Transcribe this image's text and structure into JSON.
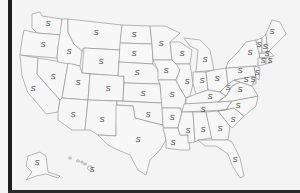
{
  "map": {
    "title": "",
    "region": "United States",
    "state_label_text": "S",
    "label_color": "#444444",
    "border_color": "#8a8a8a",
    "background": "#f4f4f4",
    "labels": [
      {
        "state": "WA",
        "text": "S",
        "x": 48,
        "y": 24
      },
      {
        "state": "OR",
        "text": "S",
        "x": 43,
        "y": 45
      },
      {
        "state": "CA",
        "text": "S",
        "x": 33,
        "y": 89
      },
      {
        "state": "NV",
        "text": "S",
        "x": 53,
        "y": 77
      },
      {
        "state": "ID",
        "text": "S",
        "x": 69,
        "y": 52
      },
      {
        "state": "MT",
        "text": "S",
        "x": 96,
        "y": 33
      },
      {
        "state": "WY",
        "text": "S",
        "x": 101,
        "y": 62
      },
      {
        "state": "UT",
        "text": "S",
        "x": 78,
        "y": 83
      },
      {
        "state": "AZ",
        "text": "S",
        "x": 73,
        "y": 115
      },
      {
        "state": "CO",
        "text": "S",
        "x": 108,
        "y": 89
      },
      {
        "state": "NM",
        "text": "S",
        "x": 102,
        "y": 120
      },
      {
        "state": "ND",
        "text": "S",
        "x": 134,
        "y": 35
      },
      {
        "state": "SD",
        "text": "S",
        "x": 134,
        "y": 54
      },
      {
        "state": "NE",
        "text": "S",
        "x": 137,
        "y": 73
      },
      {
        "state": "KS",
        "text": "S",
        "x": 143,
        "y": 94
      },
      {
        "state": "OK",
        "text": "S",
        "x": 148,
        "y": 115
      },
      {
        "state": "TX",
        "text": "S",
        "x": 138,
        "y": 140
      },
      {
        "state": "MN",
        "text": "S",
        "x": 161,
        "y": 44
      },
      {
        "state": "IA",
        "text": "S",
        "x": 166,
        "y": 71
      },
      {
        "state": "MO",
        "text": "S",
        "x": 172,
        "y": 95
      },
      {
        "state": "AR",
        "text": "S",
        "x": 172,
        "y": 118
      },
      {
        "state": "LA",
        "text": "S",
        "x": 173,
        "y": 143
      },
      {
        "state": "WI",
        "text": "S",
        "x": 182,
        "y": 54
      },
      {
        "state": "IL",
        "text": "S",
        "x": 187,
        "y": 82
      },
      {
        "state": "MI",
        "text": "S",
        "x": 205,
        "y": 60
      },
      {
        "state": "IN",
        "text": "S",
        "x": 202,
        "y": 81
      },
      {
        "state": "OH",
        "text": "S",
        "x": 217,
        "y": 79
      },
      {
        "state": "KY",
        "text": "S",
        "x": 210,
        "y": 97
      },
      {
        "state": "TN",
        "text": "S",
        "x": 203,
        "y": 110
      },
      {
        "state": "MS",
        "text": "S",
        "x": 188,
        "y": 131
      },
      {
        "state": "AL",
        "text": "S",
        "x": 203,
        "y": 130
      },
      {
        "state": "GA",
        "text": "S",
        "x": 220,
        "y": 129
      },
      {
        "state": "FL",
        "text": "S",
        "x": 235,
        "y": 160
      },
      {
        "state": "SC",
        "text": "S",
        "x": 233,
        "y": 120
      },
      {
        "state": "NC",
        "text": "S",
        "x": 238,
        "y": 106
      },
      {
        "state": "VA",
        "text": "S",
        "x": 240,
        "y": 90
      },
      {
        "state": "WV",
        "text": "S",
        "x": 228,
        "y": 88
      },
      {
        "state": "PA",
        "text": "S",
        "x": 240,
        "y": 71
      },
      {
        "state": "NY",
        "text": "S",
        "x": 250,
        "y": 53
      },
      {
        "state": "VT",
        "text": "S",
        "x": 259,
        "y": 45
      },
      {
        "state": "NH",
        "text": "S",
        "x": 265,
        "y": 47
      },
      {
        "state": "ME",
        "text": "S",
        "x": 272,
        "y": 32
      },
      {
        "state": "MA",
        "text": "S",
        "x": 267,
        "y": 54
      },
      {
        "state": "RI",
        "text": "S",
        "x": 270,
        "y": 61
      },
      {
        "state": "CT",
        "text": "S",
        "x": 263,
        "y": 61
      },
      {
        "state": "NJ",
        "text": "S",
        "x": 257,
        "y": 73
      },
      {
        "state": "DE",
        "text": "S",
        "x": 253,
        "y": 80
      },
      {
        "state": "MD",
        "text": "S",
        "x": 246,
        "y": 80
      },
      {
        "state": "AK",
        "text": "S",
        "x": 37,
        "y": 163
      },
      {
        "state": "HI",
        "text": "S",
        "x": 92,
        "y": 170
      }
    ]
  }
}
